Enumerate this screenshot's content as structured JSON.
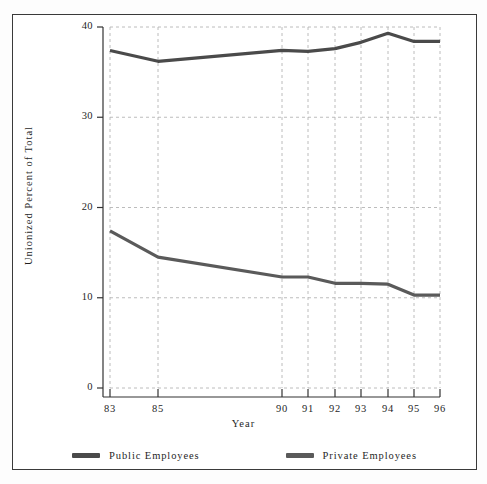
{
  "chart_data": {
    "type": "line",
    "title": "",
    "xlabel": "Year",
    "ylabel": "Unionized Percent of Total",
    "x": [
      "83",
      "85",
      "90",
      "91",
      "92",
      "93",
      "94",
      "95",
      "96"
    ],
    "x_positions": [
      110,
      158,
      282,
      308,
      335,
      361,
      388,
      414,
      440
    ],
    "xtick_labels": [
      "83",
      "85",
      "90",
      "91",
      "92",
      "93",
      "94",
      "95",
      "96"
    ],
    "ytick_labels": [
      "0",
      "10",
      "20",
      "30",
      "40"
    ],
    "ytick_values": [
      0,
      10,
      20,
      30,
      40
    ],
    "ylim": [
      0,
      40
    ],
    "grid": true,
    "legend_position": "bottom",
    "series": [
      {
        "name": "Public Employees",
        "color": "#4a4a4a",
        "values": [
          37.4,
          36.2,
          37.4,
          37.3,
          37.6,
          38.3,
          39.3,
          38.4,
          38.4
        ]
      },
      {
        "name": "Private Employees",
        "color": "#5a5a5a",
        "values": [
          17.4,
          14.5,
          12.3,
          12.3,
          11.6,
          11.6,
          11.5,
          10.3,
          10.3
        ]
      }
    ]
  },
  "axes": {
    "y_title": "Unionized Percent of Total",
    "x_title": "Year"
  },
  "legend": {
    "items": [
      {
        "label": "Public Employees",
        "color": "#4a4a4a"
      },
      {
        "label": "Private Employees",
        "color": "#5a5a5a"
      }
    ]
  },
  "colors": {
    "frame": "#3a3a3a",
    "axis": "#333333",
    "grid": "#b4b4b4",
    "background": "#ffffff"
  }
}
